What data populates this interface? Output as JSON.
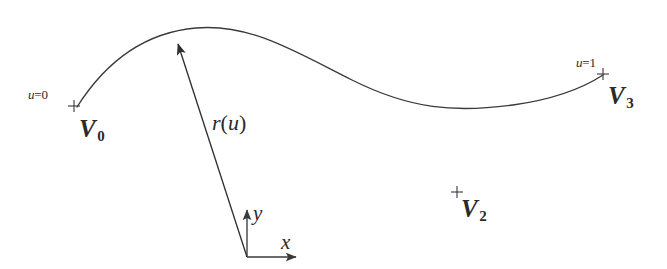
{
  "figure": {
    "type": "diagram",
    "background_color": "#ffffff",
    "stroke_color": "#3a3a3a"
  },
  "labels": {
    "u_start": {
      "prefix": "u",
      "eq": "=",
      "value": "0"
    },
    "u_end": {
      "prefix": "u",
      "eq": "=",
      "value": "1"
    },
    "v0": {
      "letter": "V",
      "subscript": "0"
    },
    "v2": {
      "letter": "V",
      "subscript": "2"
    },
    "v3": {
      "letter": "V",
      "subscript": "3"
    },
    "vector": {
      "name": "r",
      "open": "(",
      "param": "u",
      "close": ")"
    },
    "axis_x": "x",
    "axis_y": "y"
  },
  "markers": {
    "plus_v0": {
      "x": 74,
      "y": 106
    },
    "plus_v2": {
      "x": 457,
      "y": 192
    },
    "plus_v3": {
      "x": 603,
      "y": 74
    }
  },
  "geometry": {
    "curve": {
      "start": [
        77,
        107
      ],
      "peak": [
        215,
        27
      ],
      "minimum": [
        513,
        105
      ],
      "end": [
        603,
        75
      ],
      "path": "M 77,107 C 110,55 150,32 196,28 C 250,23 296,52 352,80 C 410,109 455,113 513,105 C 556,99 583,88 603,75"
    },
    "vector_arrow": {
      "from": [
        247,
        257
      ],
      "to": [
        176,
        37
      ]
    },
    "axis_origin": [
      247,
      257
    ],
    "axis_y_tip": [
      247,
      204
    ],
    "axis_x_tip": [
      302,
      257
    ]
  }
}
